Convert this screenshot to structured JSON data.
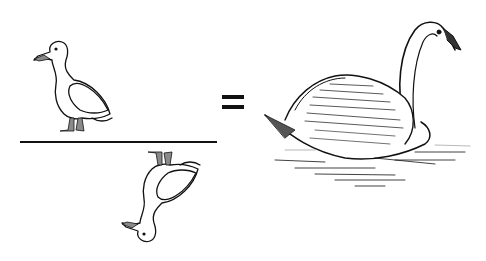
{
  "figure": {
    "numerator": {
      "icon": "duck-icon",
      "orientation": "upright"
    },
    "operator_bar": {
      "icon": "fraction-bar"
    },
    "denominator": {
      "icon": "duck-icon",
      "orientation": "upside-down"
    },
    "equals": {
      "icon": "equals-sign"
    },
    "result": {
      "icon": "swan-illustration"
    },
    "colors": {
      "ink": "#111111",
      "feet": "#8a8a8a",
      "background": "#ffffff"
    }
  }
}
